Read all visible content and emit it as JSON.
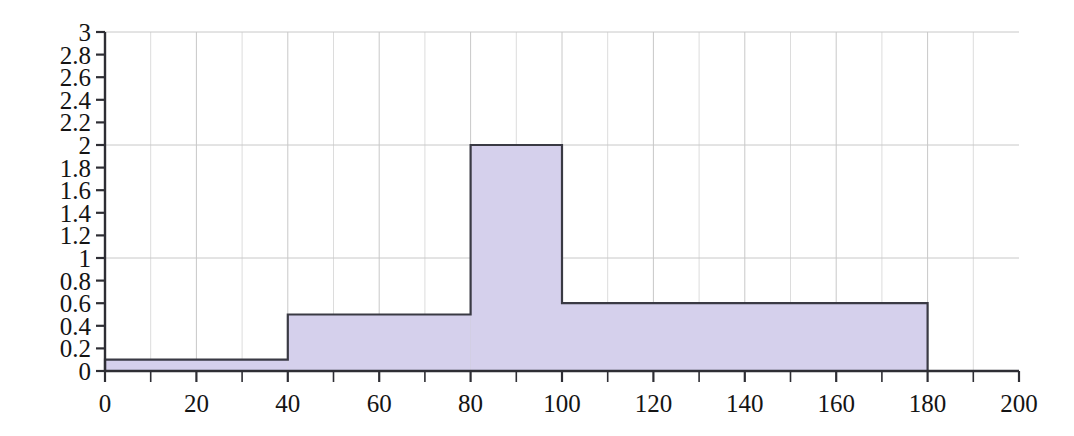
{
  "chart_data": {
    "type": "bar",
    "title": "",
    "subtitle": "",
    "xlabel": "",
    "ylabel": "",
    "xlim": [
      0,
      200
    ],
    "ylim": [
      0,
      3
    ],
    "grid": true,
    "legend": null,
    "bin_edges": [
      0,
      40,
      80,
      100,
      180
    ],
    "categories": [
      "0-40",
      "40-80",
      "80-100",
      "100-180"
    ],
    "values": [
      0.1,
      0.5,
      2.0,
      0.6
    ],
    "bars": [
      {
        "x0": 0,
        "x1": 40,
        "height": 0.1
      },
      {
        "x0": 40,
        "x1": 80,
        "height": 0.5
      },
      {
        "x0": 80,
        "x1": 100,
        "height": 2.0
      },
      {
        "x0": 100,
        "x1": 180,
        "height": 0.6
      }
    ],
    "y_ticks": [
      0,
      0.2,
      0.4,
      0.6,
      0.8,
      1,
      1.2,
      1.4,
      1.6,
      1.8,
      2,
      2.2,
      2.4,
      2.6,
      2.8,
      3
    ],
    "y_tick_labels": [
      "0",
      "0.2",
      "0.4",
      "0.6",
      "0.8",
      "1",
      "1.2",
      "1.4",
      "1.6",
      "1.8",
      "2",
      "2.2",
      "2.4",
      "2.6",
      "2.8",
      "3"
    ],
    "y_gridlines": [
      1,
      2,
      3
    ],
    "x_ticks_major": [
      0,
      20,
      40,
      60,
      80,
      100,
      120,
      140,
      160,
      180,
      200
    ],
    "x_tick_labels": [
      "0",
      "20",
      "40",
      "60",
      "80",
      "100",
      "120",
      "140",
      "160",
      "180",
      "200"
    ],
    "x_ticks_minor": [
      10,
      30,
      50,
      70,
      90,
      110,
      130,
      150,
      170,
      190
    ],
    "x_gridlines_major": [
      20,
      40,
      60,
      80,
      100,
      120,
      140,
      160,
      180
    ],
    "x_gridlines_minor": [
      10,
      30,
      50,
      70,
      90,
      110,
      130,
      150,
      170,
      190
    ]
  },
  "style": {
    "bar_fill": "#d5d0ec",
    "bar_stroke": "#3a3a44",
    "axis_color": "#2e2e34",
    "grid_major_color": "#c8c8c8",
    "grid_minor_color": "#dcdcdc",
    "background": "#ffffff",
    "text_color": "#141414"
  },
  "geometry": {
    "plot_left": 105,
    "plot_right": 1019,
    "plot_top": 32,
    "plot_bottom": 371
  }
}
